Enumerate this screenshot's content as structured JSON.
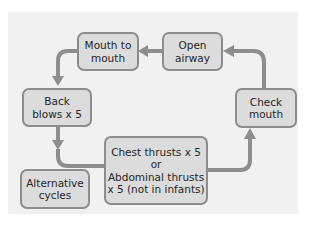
{
  "diagram": {
    "type": "flowchart-cycle",
    "colors": {
      "node_fill": "#dcdcdc",
      "node_border": "#8d8d8d",
      "arrow": "#8d8d8d",
      "panel": "#f1f1f1"
    },
    "nodes": {
      "mouth_to_mouth": {
        "lines": [
          "Mouth to",
          "mouth"
        ]
      },
      "open_airway": {
        "lines": [
          "Open",
          "airway"
        ]
      },
      "back_blows": {
        "lines": [
          "Back",
          "blows x 5"
        ]
      },
      "check_mouth": {
        "lines": [
          "Check",
          "mouth"
        ]
      },
      "chest_thrusts": {
        "lines": [
          "Chest thrusts x 5",
          "or",
          "Abdominal thrusts",
          "x 5 (not in infants)"
        ]
      },
      "alternative_cycles": {
        "lines": [
          "Alternative",
          "cycles"
        ]
      }
    },
    "edges": [
      {
        "from": "open_airway",
        "to": "mouth_to_mouth"
      },
      {
        "from": "mouth_to_mouth",
        "to": "back_blows"
      },
      {
        "from": "back_blows",
        "to": "chest_thrusts"
      },
      {
        "from": "chest_thrusts",
        "to": "check_mouth"
      },
      {
        "from": "check_mouth",
        "to": "open_airway"
      }
    ]
  }
}
